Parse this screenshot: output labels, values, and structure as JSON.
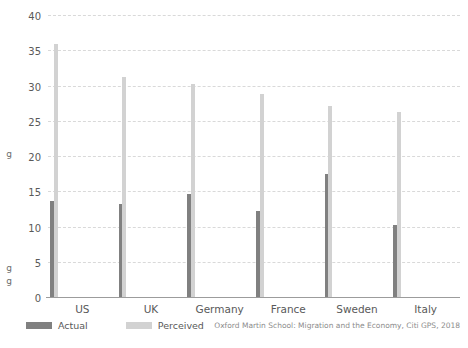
{
  "clipped_text": {
    "upper": "g",
    "lower": "g\ng"
  },
  "legend": {
    "items": [
      {
        "label": "Actual",
        "color": "#808080"
      },
      {
        "label": "Perceived",
        "color": "#d2d2d2"
      }
    ]
  },
  "source": {
    "text": "Oxford Martin School: Migration and the Economy, Citi GPS, 2018"
  },
  "chart_data": {
    "type": "bar",
    "title": "",
    "xlabel": "",
    "ylabel": "Percentage of population",
    "ylim": [
      0,
      40
    ],
    "yticks": [
      0,
      5,
      10,
      15,
      20,
      25,
      30,
      35,
      40
    ],
    "ytick_labels": [
      "0",
      "5",
      "10",
      "15",
      "20",
      "25",
      "30",
      "35",
      "40"
    ],
    "grid": true,
    "legend_position": "bottom-left",
    "categories": [
      "US",
      "UK",
      "Germany",
      "France",
      "Sweden",
      "Italy"
    ],
    "series": [
      {
        "name": "Actual",
        "color": "#808080",
        "values": [
          13.8,
          13.4,
          14.7,
          12.4,
          17.6,
          10.3
        ]
      },
      {
        "name": "Perceived",
        "color": "#d2d2d2",
        "values": [
          36.0,
          31.4,
          30.3,
          29.0,
          27.3,
          26.4
        ]
      }
    ]
  }
}
